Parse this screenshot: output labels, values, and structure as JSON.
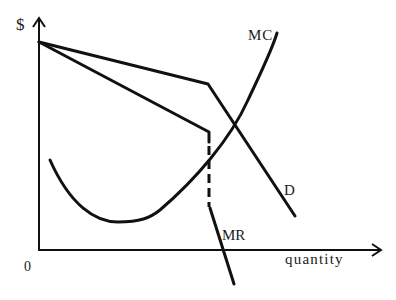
{
  "diagram": {
    "y_axis_label": "$",
    "x_axis_label": "quantity",
    "origin_label": "0",
    "curves": [
      {
        "id": "D",
        "label": "D",
        "description": "Kinked demand curve: shallow above kink, steep below"
      },
      {
        "id": "MR",
        "label": "MR",
        "description": "Marginal revenue with discontinuous (dashed) gap at kink quantity"
      },
      {
        "id": "MC",
        "label": "MC",
        "description": "U-shaped marginal cost curve crossing MR gap"
      }
    ],
    "colors": {
      "line": "#111111",
      "background": "#ffffff"
    }
  }
}
